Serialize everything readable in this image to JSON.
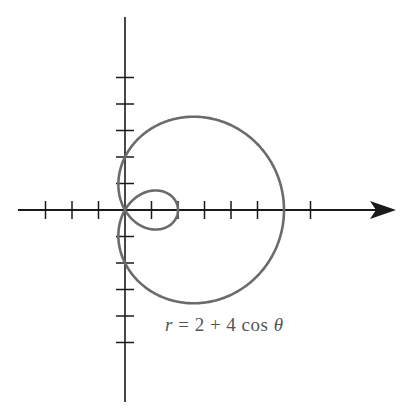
{
  "chart_data": {
    "type": "line",
    "subtype": "polar-curve (limaçon with inner loop)",
    "title": "",
    "equation": "r = 2 + 4 cos θ",
    "equation_parts": {
      "lhs": "r",
      "eq": "=",
      "a": "2",
      "plus": "+",
      "b": "4 cos",
      "theta": "θ"
    },
    "xlabel": "",
    "ylabel": "",
    "grid": false,
    "legend": "none",
    "xlim": [
      -4,
      7
    ],
    "ylim": [
      -7,
      7
    ],
    "x_ticks": [
      -3,
      -2,
      -1,
      1,
      2,
      3,
      4,
      5,
      6,
      7
    ],
    "y_ticks": [
      -5,
      -4,
      -3,
      -2,
      -1,
      1,
      2,
      3,
      4,
      5
    ],
    "polar_axis_arrow": true,
    "series": [
      {
        "name": "r = 2 + 4 cos θ",
        "a": 2,
        "b": 4,
        "theta_range": [
          0,
          6.2832
        ],
        "key_points": [
          {
            "theta": "0",
            "x": 6,
            "y": 0
          },
          {
            "theta": "π/2",
            "x": 0,
            "y": 2
          },
          {
            "theta": "2π/3",
            "x": 0,
            "y": 0
          },
          {
            "theta": "π",
            "x": 2,
            "y": 0
          },
          {
            "theta": "4π/3",
            "x": 0,
            "y": 0
          },
          {
            "theta": "3π/2",
            "x": 0,
            "y": -2
          }
        ]
      }
    ],
    "colors": {
      "curve": "#6b6b6b",
      "axes": "#1a1a1a",
      "label": "#555555"
    }
  },
  "layout": {
    "origin_px": [
      125,
      210
    ],
    "unit_px": 26.5
  }
}
